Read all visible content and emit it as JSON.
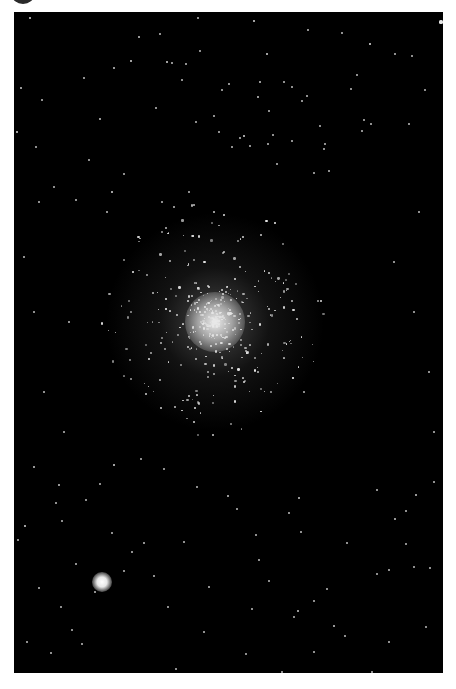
{
  "image": {
    "subject": "globular star cluster",
    "frame": {
      "x": 14,
      "y": 12,
      "width": 429,
      "height": 661,
      "background": "#000000"
    },
    "page_background": "#ffffff",
    "corner_disc_color": "#2a2a2a",
    "cluster": {
      "cx": 201,
      "cy": 310,
      "core_radius": 30,
      "halo_radius": 110,
      "core_color": "#f0f0f0"
    },
    "bright_star": {
      "cx": 88,
      "cy": 570,
      "radius": 10,
      "color": "#ffffff"
    }
  },
  "stars": [
    [
      16,
      6,
      1.6
    ],
    [
      100,
      56,
      1.4
    ],
    [
      125,
      25,
      1.4
    ],
    [
      153,
      50,
      1.6
    ],
    [
      184,
      6,
      1.2
    ],
    [
      186,
      39,
      1.2
    ],
    [
      146,
      22,
      1.0
    ],
    [
      168,
      68,
      1.0
    ],
    [
      3,
      120,
      1.6
    ],
    [
      7,
      76,
      1.4
    ],
    [
      28,
      88,
      1.0
    ],
    [
      70,
      66,
      1.0
    ],
    [
      86,
      107,
      1.4
    ],
    [
      117,
      49,
      1.6
    ],
    [
      142,
      96,
      1.0
    ],
    [
      172,
      52,
      1.0
    ],
    [
      98,
      180,
      1.6
    ],
    [
      93,
      200,
      1.0
    ],
    [
      182,
      110,
      1.2
    ],
    [
      158,
      51,
      1.0
    ],
    [
      22,
      135,
      1.0
    ],
    [
      208,
      78,
      1.2
    ],
    [
      200,
      104,
      1.0
    ],
    [
      240,
      9,
      1.6
    ],
    [
      253,
      42,
      1.6
    ],
    [
      246,
      70,
      1.4
    ],
    [
      278,
      75,
      1.0
    ],
    [
      294,
      18,
      1.0
    ],
    [
      328,
      21,
      1.0
    ],
    [
      356,
      32,
      1.8
    ],
    [
      398,
      44,
      1.2
    ],
    [
      337,
      77,
      1.2
    ],
    [
      270,
      70,
      1.0
    ],
    [
      381,
      42,
      1.0
    ],
    [
      427,
      10,
      2.0
    ],
    [
      293,
      84,
      1.0
    ],
    [
      255,
      99,
      1.0
    ],
    [
      306,
      114,
      1.2
    ],
    [
      343,
      63,
      1.0
    ],
    [
      411,
      78,
      1.2
    ],
    [
      215,
      72,
      1.0
    ],
    [
      226,
      126,
      1.2
    ],
    [
      259,
      123,
      1.0
    ],
    [
      244,
      85,
      1.4
    ],
    [
      395,
      112,
      1.0
    ],
    [
      288,
      89,
      1.0
    ],
    [
      310,
      137,
      1.2
    ],
    [
      254,
      132,
      1.0
    ],
    [
      230,
      124,
      1.6
    ],
    [
      236,
      134,
      1.0
    ],
    [
      311,
      132,
      1.0
    ],
    [
      278,
      129,
      1.0
    ],
    [
      315,
      159,
      1.0
    ],
    [
      205,
      120,
      1.0
    ],
    [
      218,
      135,
      1.0
    ],
    [
      263,
      152,
      1.0
    ],
    [
      300,
      161,
      1.2
    ],
    [
      350,
      108,
      1.2
    ],
    [
      357,
      112,
      1.0
    ],
    [
      348,
      119,
      1.0
    ],
    [
      10,
      245,
      1.0
    ],
    [
      20,
      300,
      1.2
    ],
    [
      55,
      310,
      1.0
    ],
    [
      75,
      148,
      1.2
    ],
    [
      110,
      162,
      1.2
    ],
    [
      148,
      190,
      1.2
    ],
    [
      160,
      195,
      1.0
    ],
    [
      175,
      180,
      1.2
    ],
    [
      180,
      193,
      1.0
    ],
    [
      25,
      190,
      1.0
    ],
    [
      40,
      175,
      1.2
    ],
    [
      62,
      188,
      1.0
    ],
    [
      200,
      200,
      1.4
    ],
    [
      210,
      240,
      1.2
    ],
    [
      380,
      250,
      1.0
    ],
    [
      400,
      300,
      1.2
    ],
    [
      415,
      360,
      1.0
    ],
    [
      30,
      380,
      1.0
    ],
    [
      50,
      420,
      1.2
    ],
    [
      420,
      420,
      1.0
    ],
    [
      405,
      200,
      1.0
    ],
    [
      20,
      455,
      1.4
    ],
    [
      45,
      473,
      1.4
    ],
    [
      86,
      472,
      1.2
    ],
    [
      100,
      453,
      1.6
    ],
    [
      127,
      447,
      1.2
    ],
    [
      150,
      457,
      1.2
    ],
    [
      42,
      491,
      1.0
    ],
    [
      72,
      488,
      1.2
    ],
    [
      11,
      514,
      1.6
    ],
    [
      48,
      509,
      1.2
    ],
    [
      98,
      521,
      1.2
    ],
    [
      62,
      552,
      1.0
    ],
    [
      110,
      559,
      1.2
    ],
    [
      25,
      576,
      1.2
    ],
    [
      47,
      595,
      1.2
    ],
    [
      58,
      618,
      1.2
    ],
    [
      68,
      632,
      1.0
    ],
    [
      37,
      641,
      1.0
    ],
    [
      154,
      595,
      1.2
    ],
    [
      140,
      564,
      1.0
    ],
    [
      130,
      531,
      1.0
    ],
    [
      118,
      540,
      1.0
    ],
    [
      81,
      580,
      1.0
    ],
    [
      170,
      530,
      1.0
    ],
    [
      183,
      475,
      1.2
    ],
    [
      190,
      620,
      1.0
    ],
    [
      195,
      575,
      1.0
    ],
    [
      162,
      657,
      1.2
    ],
    [
      36,
      662,
      1.0
    ],
    [
      13,
      630,
      1.0
    ],
    [
      4,
      528,
      1.0
    ],
    [
      214,
      484,
      1.4
    ],
    [
      223,
      497,
      1.2
    ],
    [
      242,
      523,
      1.2
    ],
    [
      285,
      486,
      1.4
    ],
    [
      255,
      569,
      1.2
    ],
    [
      280,
      605,
      1.2
    ],
    [
      300,
      589,
      1.2
    ],
    [
      313,
      577,
      1.2
    ],
    [
      363,
      562,
      1.2
    ],
    [
      402,
      483,
      1.4
    ],
    [
      381,
      507,
      1.4
    ],
    [
      392,
      532,
      1.2
    ],
    [
      375,
      558,
      1.0
    ],
    [
      400,
      555,
      1.2
    ],
    [
      363,
      478,
      1.0
    ],
    [
      333,
      531,
      1.0
    ],
    [
      320,
      614,
      1.4
    ],
    [
      284,
      599,
      1.4
    ],
    [
      232,
      642,
      1.2
    ],
    [
      268,
      660,
      1.0
    ],
    [
      331,
      624,
      1.0
    ],
    [
      375,
      630,
      1.0
    ],
    [
      412,
      615,
      1.2
    ],
    [
      416,
      556,
      1.0
    ],
    [
      392,
      499,
      1.0
    ],
    [
      275,
      501,
      1.0
    ],
    [
      287,
      520,
      1.0
    ],
    [
      238,
      597,
      1.0
    ],
    [
      300,
      640,
      1.0
    ],
    [
      358,
      660,
      1.0
    ],
    [
      420,
      470,
      1.0
    ],
    [
      245,
      548,
      1.0
    ]
  ],
  "cluster_member_count": 420
}
